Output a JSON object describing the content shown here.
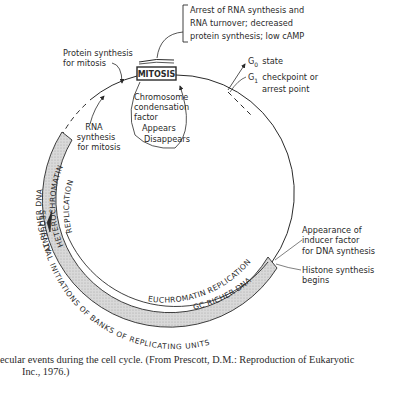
{
  "diagram": {
    "center_label": "MITOSIS",
    "top_note": {
      "lines": [
        "Arrest of RNA synthesis and",
        "RNA turnover; decreased",
        "protein synthesis; low cAMP"
      ]
    },
    "protein_synthesis": [
      "Protein synthesis",
      "for mitosis"
    ],
    "g0": {
      "symbol": "G",
      "sub": "0",
      "text": "state"
    },
    "g1": {
      "symbol": "G",
      "sub": "1",
      "text": "checkpoint or",
      "line2": "arrest point"
    },
    "chromosome_factor": [
      "Chromosome",
      "condensation",
      "factor",
      "Appears",
      "Disappears"
    ],
    "rna_synthesis": [
      "RNA",
      "synthesis",
      "for mitosis"
    ],
    "inducer": [
      "Appearance of",
      "inducer factor",
      "for DNA synthesis"
    ],
    "histone": [
      "Histone synthesis",
      "begins"
    ],
    "band_outer_left": "AT RICHER DNA",
    "band_inner_left": "HETEROCHROMATIN",
    "band_inner_left2": "REPLICATION",
    "band_outer_bottom": "GC RICHER DNA",
    "band_inner_bottom": "EUCHROMATIN REPLICATION",
    "outer_ring_text": "SEQUENTIAL INITIATIONS OF BANKS OF REPLICATING UNITS"
  },
  "caption": {
    "line1": "ecular events during the cell cycle. (From Prescott, D.M.: Reproduction of Eukaryotic",
    "line2": " Inc., 1976.)"
  }
}
